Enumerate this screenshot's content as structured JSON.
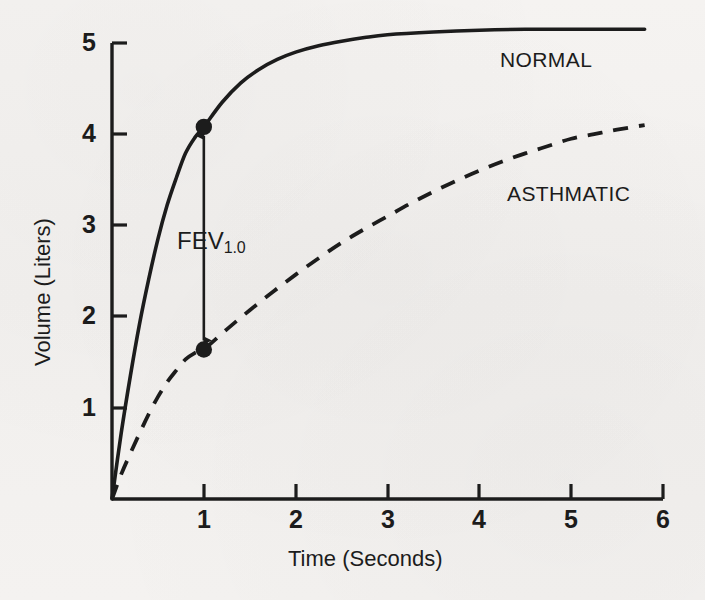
{
  "figure": {
    "background_color": "#f3f1ef",
    "ink_color": "#1c1c1c"
  },
  "axes": {
    "x_title": "Time (Seconds)",
    "y_title": "Volume (Liters)",
    "x_ticks": [
      "1",
      "2",
      "3",
      "4",
      "5",
      "6"
    ],
    "y_ticks": [
      "1",
      "2",
      "3",
      "4",
      "5"
    ]
  },
  "labels": {
    "normal": "NORMAL",
    "asthmatic": "ASTHMATIC",
    "fev_main": "FEV",
    "fev_sub": "1.0"
  },
  "chart_data": {
    "type": "line",
    "title": "",
    "xlabel": "Time (Seconds)",
    "ylabel": "Volume (Liters)",
    "xlim": [
      0,
      6
    ],
    "ylim": [
      0,
      5.3
    ],
    "xticks": [
      1,
      2,
      3,
      4,
      5,
      6
    ],
    "yticks": [
      1,
      2,
      3,
      4,
      5
    ],
    "grid": false,
    "legend": "inline-annotation",
    "series": [
      {
        "name": "NORMAL",
        "style": "solid",
        "color": "#1c1c1c",
        "x": [
          0,
          0.1,
          0.2,
          0.3,
          0.4,
          0.5,
          0.6,
          0.7,
          0.8,
          0.9,
          1.0,
          1.2,
          1.4,
          1.6,
          1.8,
          2.0,
          2.25,
          2.5,
          2.75,
          3.0,
          3.5,
          4.0,
          4.5,
          5.0,
          5.4,
          5.8
        ],
        "y": [
          0,
          0.72,
          1.35,
          1.92,
          2.41,
          2.85,
          3.22,
          3.52,
          3.79,
          3.96,
          4.08,
          4.35,
          4.56,
          4.71,
          4.82,
          4.9,
          4.97,
          5.02,
          5.06,
          5.09,
          5.12,
          5.14,
          5.15,
          5.15,
          5.15,
          5.15
        ],
        "label_position": [
          5.25,
          4.85
        ]
      },
      {
        "name": "ASTHMATIC",
        "style": "dashed",
        "color": "#1c1c1c",
        "x": [
          0,
          0.1,
          0.2,
          0.3,
          0.4,
          0.5,
          0.6,
          0.7,
          0.8,
          0.9,
          1.0,
          1.25,
          1.5,
          1.75,
          2.0,
          2.25,
          2.5,
          2.75,
          3.0,
          3.25,
          3.5,
          3.75,
          4.0,
          4.25,
          4.5,
          4.75,
          5.0,
          5.25,
          5.5,
          5.8
        ],
        "y": [
          0,
          0.27,
          0.5,
          0.72,
          0.93,
          1.12,
          1.28,
          1.41,
          1.53,
          1.6,
          1.64,
          1.86,
          2.07,
          2.27,
          2.46,
          2.64,
          2.81,
          2.96,
          3.1,
          3.24,
          3.37,
          3.49,
          3.6,
          3.7,
          3.79,
          3.87,
          3.95,
          4.0,
          4.05,
          4.1
        ],
        "label_position": [
          5.3,
          3.45
        ]
      }
    ],
    "markers": [
      {
        "series": "NORMAL",
        "x": 1.0,
        "y": 4.08,
        "shape": "filled-circle"
      },
      {
        "series": "ASTHMATIC",
        "x": 1.0,
        "y": 1.64,
        "shape": "filled-circle"
      }
    ],
    "annotations": [
      {
        "text": "FEV1.0",
        "type": "double-headed-arrow",
        "x": 1.0,
        "y_from": 1.64,
        "y_to": 4.08,
        "label_x": 0.72,
        "label_y": 2.97
      }
    ]
  }
}
